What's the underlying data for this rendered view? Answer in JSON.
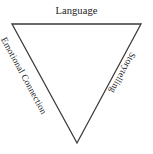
{
  "canvas": {
    "width": 153,
    "height": 154,
    "background_color": "#ffffff"
  },
  "diagram": {
    "type": "inverted-triangle",
    "shape_name": "triangle",
    "stroke_color": "#3a3a3a",
    "stroke_width": 1.3,
    "fill_color": "none",
    "vertices": {
      "top_left": {
        "x": 12,
        "y": 24
      },
      "top_right": {
        "x": 141,
        "y": 24
      },
      "bottom_apex": {
        "x": 77,
        "y": 143
      }
    },
    "points_path": "12,24 141,24 77,143",
    "labels": [
      {
        "id": "top",
        "text": "Language",
        "edge": "top",
        "rotation_deg": 0,
        "font_size": 10.5,
        "color": "#222222"
      },
      {
        "id": "left",
        "text": "Emotional Connection",
        "edge": "left",
        "rotation_deg": 61.5,
        "font_size": 9.3,
        "color": "#222222"
      },
      {
        "id": "right",
        "text": "Storytelling",
        "edge": "right",
        "rotation_deg": 118.5,
        "font_size": 9.3,
        "color": "#222222"
      }
    ]
  }
}
